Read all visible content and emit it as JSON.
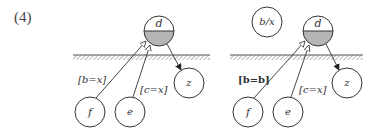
{
  "figure": {
    "label": "(4)",
    "colors": {
      "stroke": "#333333",
      "fill_shaded": "#b5b5b5",
      "ground_hatch": "#777777",
      "background": "#ffffff"
    },
    "left_diagram": {
      "nodes": [
        {
          "id": "d",
          "label": "d",
          "cx": 159,
          "cy": 31,
          "r": 15,
          "half_shaded": true
        },
        {
          "id": "f",
          "label": "f",
          "cx": 90,
          "cy": 112,
          "r": 15
        },
        {
          "id": "e",
          "label": "e",
          "cx": 130,
          "cy": 112,
          "r": 15
        },
        {
          "id": "z",
          "label": "z",
          "cx": 189,
          "cy": 83,
          "r": 15
        }
      ],
      "edges": [
        {
          "from": "f",
          "to": "d",
          "label": "[b=x]",
          "label_style": "italic",
          "arrowhead": "open"
        },
        {
          "from": "e",
          "to": "d",
          "label": "[c=x]",
          "label_style": "italic",
          "arrowhead": "open"
        },
        {
          "from": "d",
          "to": "z",
          "label": "",
          "arrowhead": "filled"
        }
      ],
      "ground_line": {
        "x1": 73,
        "x2": 210,
        "y": 57
      }
    },
    "right_diagram": {
      "nodes": [
        {
          "id": "bx",
          "label": "b/x",
          "cx": 267,
          "cy": 22,
          "r": 15
        },
        {
          "id": "d",
          "label": "d",
          "cx": 318,
          "cy": 31,
          "r": 15,
          "half_shaded": true
        },
        {
          "id": "f",
          "label": "f",
          "cx": 248,
          "cy": 112,
          "r": 15
        },
        {
          "id": "e",
          "label": "e",
          "cx": 288,
          "cy": 112,
          "r": 15
        },
        {
          "id": "z",
          "label": "z",
          "cx": 347,
          "cy": 83,
          "r": 15
        }
      ],
      "edges": [
        {
          "from": "f",
          "to": "d",
          "label": "[b=b]",
          "label_style": "bold",
          "arrowhead": "open"
        },
        {
          "from": "e",
          "to": "d",
          "label": "[c=x]",
          "label_style": "italic",
          "arrowhead": "open"
        },
        {
          "from": "d",
          "to": "z",
          "label": "",
          "arrowhead": "filled"
        }
      ],
      "ground_line": {
        "x1": 230,
        "x2": 363,
        "y": 57
      }
    }
  },
  "labels": {
    "fig": "(4)",
    "L": {
      "d": "d",
      "f": "f",
      "e": "e",
      "z": "z",
      "edge_fd": "[b=x]",
      "edge_ed": "[c=x]"
    },
    "R": {
      "bx": "b/x",
      "d": "d",
      "f": "f",
      "e": "e",
      "z": "z",
      "edge_fd": "[b=b]",
      "edge_ed": "[c=x]"
    }
  }
}
